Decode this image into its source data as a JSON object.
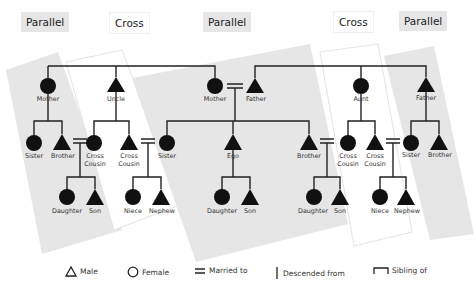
{
  "headers": [
    {
      "label": "Parallel",
      "type": "parallel",
      "x": 21,
      "y": 12
    },
    {
      "label": "Cross",
      "type": "cross",
      "x": 109,
      "y": 12
    },
    {
      "label": "Parallel",
      "type": "parallel",
      "x": 203,
      "y": 12
    },
    {
      "label": "Cross",
      "type": "cross",
      "x": 333,
      "y": 11
    },
    {
      "label": "Parallel",
      "type": "parallel",
      "x": 399,
      "y": 11
    }
  ],
  "nodes": {
    "mother_left": {
      "label": "Mother",
      "sex": "female"
    },
    "uncle": {
      "label": "Uncle",
      "sex": "male"
    },
    "mother_mid": {
      "label": "Mother",
      "sex": "female"
    },
    "father_mid": {
      "label": "Father",
      "sex": "male"
    },
    "aunt": {
      "label": "Aunt",
      "sex": "female"
    },
    "father_right": {
      "label": "Father",
      "sex": "male"
    },
    "sister_left": {
      "label": "Sister",
      "sex": "female"
    },
    "brother_left": {
      "label": "Brother",
      "sex": "male"
    },
    "cross_cousin_1": {
      "label": "Cross",
      "label2": "Cousin",
      "sex": "female"
    },
    "cross_cousin_2": {
      "label": "Cross",
      "label2": "Cousin",
      "sex": "male"
    },
    "sister_mid": {
      "label": "Sister",
      "sex": "female"
    },
    "ego": {
      "label": "Ego",
      "sex": "male"
    },
    "brother_mid": {
      "label": "Brother",
      "sex": "male"
    },
    "cross_cousin_3": {
      "label": "Cross",
      "label2": "Cousin",
      "sex": "female"
    },
    "cross_cousin_4": {
      "label": "Cross",
      "label2": "Cousin",
      "sex": "male"
    },
    "sister_right": {
      "label": "Sister",
      "sex": "female"
    },
    "brother_right": {
      "label": "Brother",
      "sex": "male"
    },
    "daughter_1": {
      "label": "Daughter",
      "sex": "female"
    },
    "son_1": {
      "label": "Son",
      "sex": "male"
    },
    "niece_1": {
      "label": "Niece",
      "sex": "female"
    },
    "nephew_1": {
      "label": "Nephew",
      "sex": "male"
    },
    "daughter_2": {
      "label": "Daughter",
      "sex": "female"
    },
    "son_2": {
      "label": "Son",
      "sex": "male"
    },
    "daughter_3": {
      "label": "Daughter",
      "sex": "female"
    },
    "son_3": {
      "label": "Son",
      "sex": "male"
    },
    "niece_2": {
      "label": "Niece",
      "sex": "female"
    },
    "nephew_2": {
      "label": "Nephew",
      "sex": "male"
    }
  },
  "legend": {
    "male": "Male",
    "female": "Female",
    "married": "Married to",
    "descended": "Descended from",
    "sibling": "Sibling of"
  },
  "colors": {
    "parallel_bg": "#e6e6e6",
    "cross_bg": "#ffffff",
    "symbol": "#111111",
    "line": "#222222"
  }
}
